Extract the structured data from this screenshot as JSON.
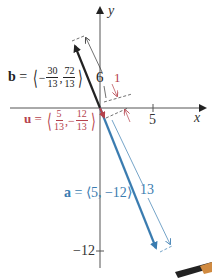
{
  "colors": {
    "axis": "#555555",
    "b_vector": "#222222",
    "u_vector": "#b5424c",
    "a_vector": "#3a7cb0",
    "dim": "#333333"
  },
  "axes": {
    "x_label": "x",
    "y_label": "y",
    "x_tick_label": "5",
    "y_tick_label": "−12"
  },
  "vectors": {
    "b": {
      "name": "b",
      "eq": "=",
      "x_num": "30",
      "x_den": "13",
      "x_sign": "−",
      "y_num": "72",
      "y_den": "13",
      "length_label": "6"
    },
    "u": {
      "name": "u",
      "eq": "=",
      "x_num": "5",
      "x_den": "13",
      "y_sign": "−",
      "y_num": "12",
      "y_den": "13",
      "length_label": "1"
    },
    "a": {
      "name": "a",
      "expr": "= ⟨5, −12⟩",
      "length_label": "13"
    }
  }
}
